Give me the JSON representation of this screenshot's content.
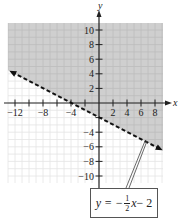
{
  "chart_data": {
    "type": "line",
    "title": "",
    "subtitle": "",
    "xlabel": "x",
    "ylabel": "y",
    "xlim": [
      -13,
      9
    ],
    "ylim": [
      -11,
      11
    ],
    "grid": true,
    "x_ticks": [
      -12,
      -10,
      -8,
      -6,
      -4,
      -2,
      2,
      4,
      6,
      8
    ],
    "x_tick_labels": [
      "-12",
      "-8",
      "-4",
      "2",
      "4",
      "6",
      "8"
    ],
    "y_ticks": [
      10,
      8,
      6,
      4,
      2,
      -2,
      -4,
      -6,
      -8,
      -10
    ],
    "y_tick_labels": [
      "10",
      "8",
      "6",
      "4",
      "2",
      "-4",
      "-6",
      "-8",
      "-10"
    ],
    "series": [
      {
        "name": "y = -1/2 x - 2",
        "style": "dashed",
        "slope": -0.5,
        "intercept": -2,
        "x": [
          -13,
          8.5
        ],
        "y": [
          4.5,
          -6.25
        ]
      }
    ],
    "shaded_region": "above the line (y > -1/2 x - 2)",
    "annotations": [
      {
        "text": "y = -1/2 x - 2",
        "points_to": [
          7,
          -5.5
        ]
      }
    ]
  },
  "labels": {
    "x_axis": "x",
    "y_axis": "y",
    "x_ticks": [
      {
        "v": -12,
        "t": "−12"
      },
      {
        "v": -8,
        "t": "−8"
      },
      {
        "v": -4,
        "t": "−4"
      },
      {
        "v": 2,
        "t": "2"
      },
      {
        "v": 4,
        "t": "4"
      },
      {
        "v": 6,
        "t": "6"
      },
      {
        "v": 8,
        "t": "8"
      }
    ],
    "y_ticks": [
      {
        "v": 10,
        "t": "10"
      },
      {
        "v": 8,
        "t": "8"
      },
      {
        "v": 6,
        "t": "6"
      },
      {
        "v": 4,
        "t": "4"
      },
      {
        "v": 2,
        "t": "2"
      },
      {
        "v": -4,
        "t": "−4"
      },
      {
        "v": -6,
        "t": "−6"
      },
      {
        "v": -8,
        "t": "−8"
      },
      {
        "v": -10,
        "t": "−10"
      }
    ]
  },
  "equation": {
    "lhs": "y = −",
    "num": "1",
    "den": "2",
    "var": "x",
    "rhs": " − 2"
  },
  "colors": {
    "shade": "#cfcfcf",
    "grid": "#e4e4e4",
    "grid_shaded": "#bdbdbd",
    "axis": "#222222",
    "line": "#111111"
  }
}
